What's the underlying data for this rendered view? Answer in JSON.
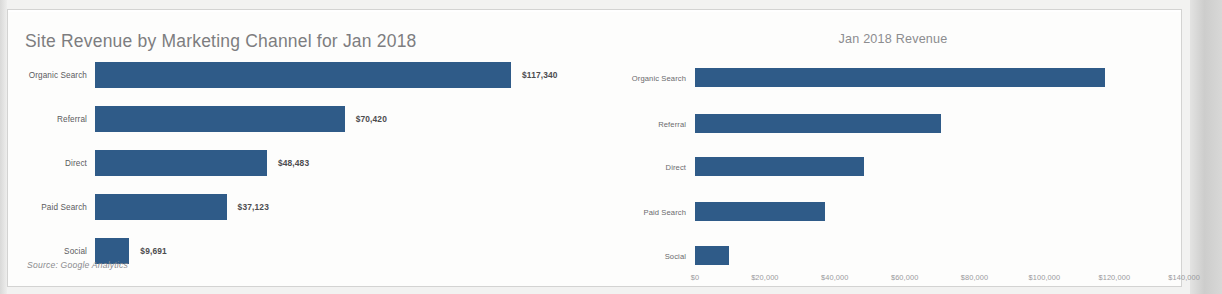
{
  "document": {
    "source_note": "Source: Google Analytics"
  },
  "chart_data": [
    {
      "id": "left",
      "type": "bar",
      "orientation": "horizontal",
      "title": "Site Revenue by Marketing Channel for Jan 2018",
      "xlabel": "",
      "ylabel": "",
      "grid": false,
      "legend": "none",
      "axis_visible": false,
      "data_labels": true,
      "bar_color": "#2f5b88",
      "categories": [
        "Organic Search",
        "Referral",
        "Direct",
        "Paid Search",
        "Social"
      ],
      "values": [
        117340,
        70420,
        48483,
        37123,
        9691
      ],
      "value_labels": [
        "$117,340",
        "$70,420",
        "$48,483",
        "$37,123",
        "$9,691"
      ],
      "xlim": [
        0,
        123000
      ]
    },
    {
      "id": "right",
      "type": "bar",
      "orientation": "horizontal",
      "title": "Jan 2018 Revenue",
      "xlabel": "",
      "ylabel": "",
      "grid": false,
      "legend": "none",
      "axis_visible": true,
      "data_labels": false,
      "bar_color": "#2f5b88",
      "categories": [
        "Organic Search",
        "Referral",
        "Direct",
        "Paid Search",
        "Social"
      ],
      "values": [
        117340,
        70420,
        48483,
        37123,
        9691
      ],
      "xlim": [
        0,
        140000
      ],
      "xticks": [
        0,
        20000,
        40000,
        60000,
        80000,
        100000,
        120000,
        140000
      ],
      "xtick_labels": [
        "$0",
        "$20,000",
        "$40,000",
        "$60,000",
        "$80,000",
        "$100,000",
        "$120,000",
        "$140,000"
      ]
    }
  ]
}
